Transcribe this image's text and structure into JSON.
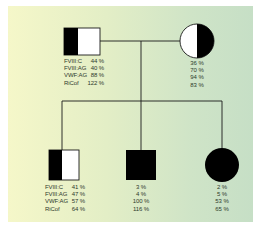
{
  "colors": {
    "background_left": "#f5f7c9",
    "background_right": "#c6dfc6",
    "affected": "#000000",
    "unaffected": "#ffffff",
    "line": "#1a1a1a",
    "text": "#2e3a2c"
  },
  "parameters": [
    "FVIII:C",
    "FVIII:AG",
    "VWF:AG",
    "RiCof"
  ],
  "individuals": {
    "father": {
      "symbol": "square",
      "sex": "male",
      "fill": "left-half-filled",
      "labels": [
        "FVIII:C",
        "FVIII:AG",
        "VWF:AG",
        "RiCof"
      ],
      "values": [
        "44 %",
        "40 %",
        "88 %",
        "122 %"
      ]
    },
    "mother": {
      "symbol": "circle",
      "sex": "female",
      "fill": "right-half-filled",
      "values": [
        "36 %",
        "70 %",
        "94 %",
        "83 %"
      ]
    },
    "child1": {
      "symbol": "square",
      "sex": "male",
      "fill": "left-half-filled",
      "labels": [
        "FVIII:C",
        "FVIII:AG",
        "VWF:AG",
        "RiCof"
      ],
      "values": [
        "41 %",
        "47 %",
        "57 %",
        "64 %"
      ]
    },
    "child2": {
      "symbol": "square",
      "sex": "male",
      "fill": "fully-filled",
      "values": [
        "3 %",
        "4 %",
        "100 %",
        "116 %"
      ]
    },
    "child3": {
      "symbol": "circle",
      "sex": "female",
      "fill": "fully-filled",
      "values": [
        "2 %",
        "5 %",
        "53 %",
        "65 %"
      ]
    }
  }
}
